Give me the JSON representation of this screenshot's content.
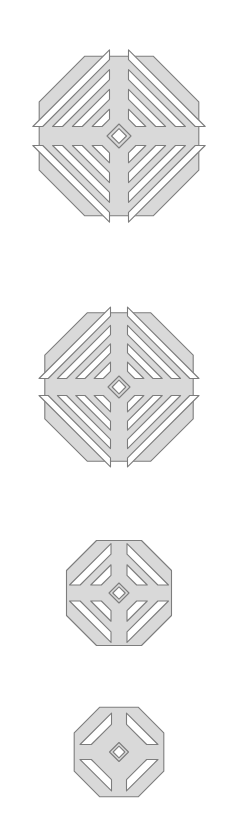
{
  "page": {
    "background_color": "#ffffff",
    "width": 238,
    "height": 820
  },
  "style": {
    "fill_color": "#d9d9d9",
    "stroke_color": "#7d7d7d",
    "stroke_width": 1.1,
    "center_hole_label": "diamond-aperture"
  },
  "figures": [
    {
      "name": "grille-plate-1",
      "label": "Octagonal grille plate, largest",
      "cx": 119,
      "cy": 136,
      "radius": 114,
      "corner_cut": 0.3,
      "arm_half_width": 9.5,
      "center_hole": 12,
      "slots_per_quadrant": 4,
      "slot_thickness": 7.0,
      "slot_gap": 7.0,
      "rim": 9.5
    },
    {
      "name": "grille-plate-2",
      "label": "Octagonal grille plate, second",
      "cx": 119,
      "cy": 387,
      "radius": 106,
      "corner_cut": 0.3,
      "arm_half_width": 8.5,
      "center_hole": 11,
      "slots_per_quadrant": 4,
      "slot_thickness": 6.5,
      "slot_gap": 6.5,
      "rim": 9.0
    },
    {
      "name": "grille-plate-3",
      "label": "Octagonal grille plate, third",
      "cx": 119,
      "cy": 593,
      "radius": 75,
      "corner_cut": 0.3,
      "arm_half_width": 8.0,
      "center_hole": 10,
      "slots_per_quadrant": 2,
      "slot_thickness": 7.5,
      "slot_gap": 7.5,
      "rim": 9.0
    },
    {
      "name": "grille-plate-4",
      "label": "Octagonal grille plate, smallest",
      "cx": 119,
      "cy": 752,
      "radius": 64,
      "corner_cut": 0.3,
      "arm_half_width": 7.5,
      "center_hole": 9.5,
      "slots_per_quadrant": 1,
      "slot_thickness": 8.0,
      "slot_gap": 8.0,
      "rim": 9.0
    }
  ]
}
